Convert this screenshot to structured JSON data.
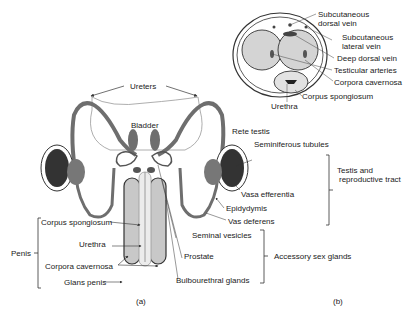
{
  "figure_a": {
    "caption": "(a)",
    "labels": {
      "ureters": "Ureters",
      "bladder": "Bladder",
      "rete_testis": "Rete testis",
      "seminiferous_tubules": "Seminiferous tubules",
      "vasa_efferentia": "Vasa efferentia",
      "epididymis": "Epidydymis",
      "vas_deferens": "Vas deferens",
      "seminal_vesicles": "Seminal vesicles",
      "prostate": "Prostate",
      "bulbourethral_glands": "Bulbourethral glands",
      "corpus_spongiosum": "Corpus spongiosum",
      "urethra": "Urethra",
      "corpora_cavernosa": "Corpora cavernosa",
      "glans_penis": "Glans penis"
    },
    "groups": {
      "penis": "Penis",
      "testis_line1": "Testis and",
      "testis_line2": "reproductive tract",
      "accessory": "Accessory sex glands"
    }
  },
  "figure_b": {
    "caption": "(b)",
    "labels": {
      "subcutaneous_dorsal_1": "Subcutaneous",
      "subcutaneous_dorsal_2": "dorsal vein",
      "subcutaneous_lateral_1": "Subcutaneous",
      "subcutaneous_lateral_2": "lateral vein",
      "deep_dorsal_vein": "Deep dorsal vein",
      "testicular_arteries": "Testicular arteries",
      "corpora_cavernosa": "Corpora cavernosa",
      "corpus_spongiosum": "Corpus spongiosum",
      "urethra": "Urethra"
    }
  },
  "colors": {
    "tube": "#6e6e6e",
    "tissue": "#c8c8c8",
    "outline": "#333333",
    "text": "#222222"
  }
}
